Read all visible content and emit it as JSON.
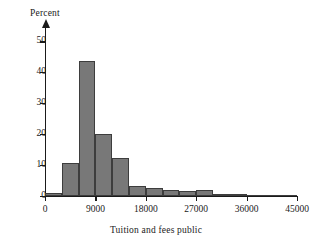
{
  "chart_data": {
    "type": "bar",
    "title": "",
    "xlabel": "Tuition and fees public",
    "ylabel": "Percent",
    "xlim": [
      0,
      45000
    ],
    "ylim": [
      0,
      55
    ],
    "grid": false,
    "legend": "none",
    "bin_width": 3000,
    "xticks": [
      0,
      9000,
      18000,
      27000,
      36000,
      45000
    ],
    "xtick_labels": [
      "0",
      "9000",
      "18000",
      "27000",
      "36000",
      "45000"
    ],
    "yticks": [
      0,
      10,
      20,
      30,
      40,
      50
    ],
    "ytick_labels": [
      "0",
      "10",
      "20",
      "30",
      "40",
      "50"
    ],
    "categories": [
      "0-3000",
      "3000-6000",
      "6000-9000",
      "9000-12000",
      "12000-15000",
      "15000-18000",
      "18000-21000",
      "21000-24000",
      "24000-27000",
      "27000-30000",
      "30000-33000",
      "33000-36000",
      "36000-39000",
      "39000-42000",
      "42000-45000"
    ],
    "bin_starts": [
      0,
      3000,
      6000,
      9000,
      12000,
      15000,
      18000,
      21000,
      24000,
      27000,
      30000,
      33000,
      36000,
      39000,
      42000
    ],
    "values": [
      1.0,
      10.7,
      43.7,
      20.0,
      12.3,
      3.4,
      2.7,
      2.0,
      1.6,
      2.0,
      0.4,
      0.2,
      0.1,
      0.0,
      0.1
    ],
    "bar_fill_color": "#787878",
    "bar_edge_color": "#3d3d3d",
    "axis_color": "#1a1a1a"
  }
}
